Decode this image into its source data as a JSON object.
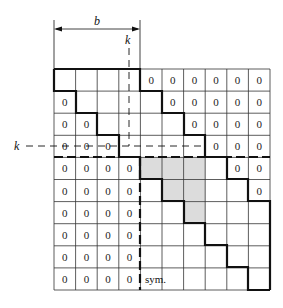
{
  "diagram": {
    "grid": {
      "rows": 10,
      "cols": 10,
      "left": 54,
      "top": 69,
      "right": 270,
      "bottom": 290,
      "cell_value": "0"
    },
    "zeros": {
      "upper": [
        [
          0,
          4
        ],
        [
          0,
          5
        ],
        [
          0,
          6
        ],
        [
          0,
          7
        ],
        [
          0,
          8
        ],
        [
          0,
          9
        ],
        [
          1,
          5
        ],
        [
          1,
          6
        ],
        [
          1,
          7
        ],
        [
          1,
          8
        ],
        [
          1,
          9
        ],
        [
          2,
          6
        ],
        [
          2,
          7
        ],
        [
          2,
          8
        ],
        [
          2,
          9
        ],
        [
          3,
          7
        ],
        [
          3,
          8
        ],
        [
          3,
          9
        ],
        [
          4,
          8
        ],
        [
          4,
          9
        ],
        [
          5,
          9
        ]
      ],
      "lower": [
        [
          1,
          0
        ],
        [
          2,
          0
        ],
        [
          2,
          1
        ],
        [
          3,
          0
        ],
        [
          3,
          1
        ],
        [
          3,
          2
        ],
        [
          4,
          0
        ],
        [
          4,
          1
        ],
        [
          4,
          2
        ],
        [
          4,
          3
        ],
        [
          5,
          0
        ],
        [
          5,
          1
        ],
        [
          5,
          2
        ],
        [
          5,
          3
        ],
        [
          6,
          0
        ],
        [
          6,
          1
        ],
        [
          6,
          2
        ],
        [
          6,
          3
        ],
        [
          7,
          0
        ],
        [
          7,
          1
        ],
        [
          7,
          2
        ],
        [
          7,
          3
        ],
        [
          8,
          0
        ],
        [
          8,
          1
        ],
        [
          8,
          2
        ],
        [
          8,
          3
        ],
        [
          9,
          0
        ],
        [
          9,
          1
        ],
        [
          9,
          2
        ],
        [
          9,
          3
        ]
      ]
    },
    "shaded_cells": [
      [
        4,
        4
      ],
      [
        4,
        5
      ],
      [
        4,
        6
      ],
      [
        5,
        5
      ],
      [
        5,
        6
      ],
      [
        6,
        6
      ]
    ],
    "shade_color": "#dcdcdc",
    "labels": {
      "bandwidth": "b",
      "k_top": "k",
      "k_left": "k",
      "sym": "sym."
    }
  }
}
